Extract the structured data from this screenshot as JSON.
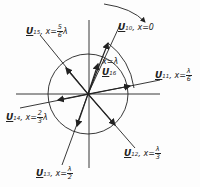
{
  "diagram": {
    "type": "phasor-diagram",
    "phasors": [
      {
        "name": "U",
        "sub": "10",
        "x_label": "x=0"
      },
      {
        "name": "U",
        "sub": "11",
        "x_label": "x=",
        "num": "λ",
        "den": "6"
      },
      {
        "name": "U",
        "sub": "12",
        "x_label": "x=",
        "num": "λ",
        "den": "3"
      },
      {
        "name": "U",
        "sub": "13",
        "x_label": "x=",
        "num": "λ",
        "den": "2"
      },
      {
        "name": "U",
        "sub": "14",
        "x_label": "x=",
        "num": "2",
        "den": "3",
        "suffix": "λ"
      },
      {
        "name": "U",
        "sub": "15",
        "x_label": "x=",
        "num": "5",
        "den": "6",
        "suffix": "λ"
      },
      {
        "name": "U",
        "sub": "16",
        "x_label": "x=λ"
      }
    ],
    "rotation_arrow": "clockwise-arrow"
  }
}
